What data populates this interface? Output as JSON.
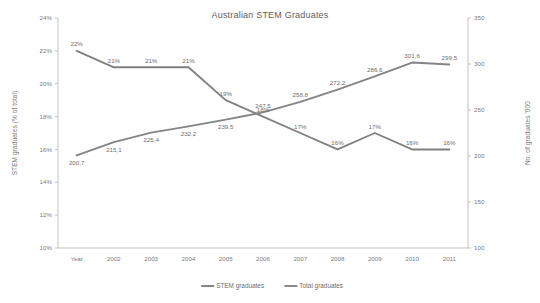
{
  "chart_data": {
    "type": "line",
    "title": "Australian STEM Graduates",
    "xlabel": "",
    "categories": [
      "Year",
      "2002",
      "2003",
      "2004",
      "2005",
      "2006",
      "2007",
      "2008",
      "2009",
      "2010",
      "2011"
    ],
    "grid": false,
    "legend_position": "bottom",
    "axes": {
      "left": {
        "label": "STEM graduates (% of total)",
        "ylim": [
          10,
          24
        ],
        "ticks": [
          10,
          12,
          14,
          16,
          18,
          20,
          22,
          24
        ],
        "tick_labels": [
          "10%",
          "12%",
          "14%",
          "16%",
          "18%",
          "20%",
          "22%",
          "24%"
        ]
      },
      "right": {
        "label": "No. of graduates '000",
        "ylim": [
          100,
          350
        ],
        "ticks": [
          100,
          150,
          200,
          250,
          300,
          350
        ],
        "tick_labels": [
          "100",
          "150",
          "200",
          "250",
          "300",
          "350"
        ]
      }
    },
    "series": [
      {
        "name": "STEM graduates",
        "axis": "left",
        "color": "#808080",
        "values": [
          22,
          21,
          21,
          21,
          19,
          18,
          17,
          16,
          17,
          16,
          16
        ],
        "data_labels": [
          "22%",
          "21%",
          "21%",
          "21%",
          "19%",
          "18%",
          "17%",
          "16%",
          "17%",
          "16%",
          "16%"
        ]
      },
      {
        "name": "Total graduates",
        "axis": "right",
        "color": "#848484",
        "values": [
          200.7,
          215.1,
          225.4,
          232.2,
          239.5,
          247.5,
          258.8,
          272.2,
          286.6,
          301.6,
          299.5
        ],
        "data_labels": [
          "200,7",
          "215,1",
          "225,4",
          "232,2",
          "239,5",
          "247,5",
          "258,8",
          "272,2",
          "286,6",
          "301,6",
          "299,5"
        ]
      }
    ]
  }
}
